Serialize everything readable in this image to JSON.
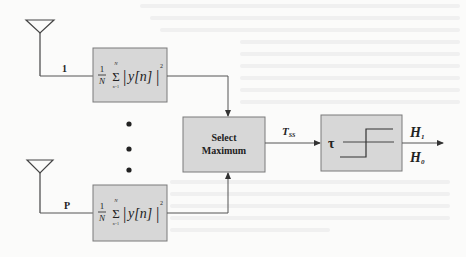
{
  "diagram": {
    "type": "block-diagram",
    "branches": [
      {
        "id": "branch-1",
        "antenna_label": "1",
        "energy_block": {
          "prefix_num": "1",
          "prefix_den": "N",
          "sum_upper": "N",
          "sum_lower": "n=1",
          "sigma": "Σ",
          "body": "y[n]",
          "abs_open": "|",
          "abs_close": "|",
          "power": "2"
        }
      },
      {
        "id": "branch-p",
        "antenna_label": "P",
        "energy_block": {
          "prefix_num": "1",
          "prefix_den": "N",
          "sum_upper": "N",
          "sum_lower": "n=1",
          "sigma": "Σ",
          "body": "y[n]",
          "abs_open": "|",
          "abs_close": "|",
          "power": "2"
        }
      }
    ],
    "ellipsis_dots": 3,
    "select_block": {
      "line1": "Select",
      "line2": "Maximum"
    },
    "test_statistic": {
      "symbol": "T",
      "subscript": "SS"
    },
    "threshold_block": {
      "symbol": "τ"
    },
    "outputs": [
      {
        "symbol": "H",
        "subscript": "1"
      },
      {
        "symbol": "H",
        "subscript": "0"
      }
    ]
  },
  "colors": {
    "block_fill": "#d7d7d7",
    "block_stroke": "#7a7a7a",
    "wire": "#555555",
    "text": "#222222",
    "background": "#fbfbfa"
  }
}
